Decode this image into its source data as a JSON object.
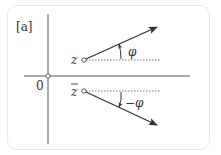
{
  "panel_label": "[a]",
  "origin_label": "0",
  "point_z_label": "z",
  "point_zbar_label": "z",
  "angle_label": "φ",
  "neg_angle_label": "−φ",
  "colors": {
    "line": "#333333",
    "frame": "#e8e8e8"
  }
}
